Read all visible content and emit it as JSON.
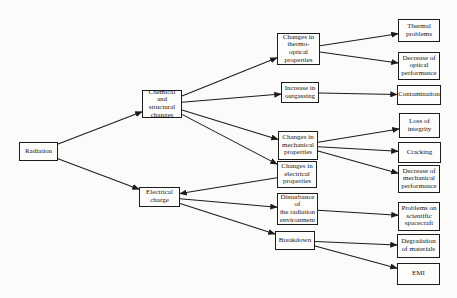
{
  "diagram": {
    "background": "#fbfbf9",
    "box_fill": "#fdfdfc",
    "box_border_color": "#1c1c1c",
    "arrow_color": "#1c1c1c",
    "text_color": "#161616",
    "nodes": [
      {
        "id": "radiation",
        "label": "Radiation",
        "x": 19,
        "y": 142,
        "w": 39,
        "h": 19
      },
      {
        "id": "chemical-changes",
        "label": "Chemical and\nstructural\nchanges",
        "x": 142,
        "y": 90,
        "w": 40,
        "h": 28
      },
      {
        "id": "electrical-charge",
        "label": "Electrical\ncharge",
        "x": 139,
        "y": 187,
        "w": 41,
        "h": 20
      },
      {
        "id": "thermo-optical",
        "label": "Changes in\nthermo-optical\nproperties",
        "x": 277,
        "y": 33,
        "w": 43,
        "h": 32
      },
      {
        "id": "outgassing",
        "label": "Increase in\noutgassing",
        "x": 281,
        "y": 82,
        "w": 38,
        "h": 21
      },
      {
        "id": "mechanical-properties",
        "label": "Changes in\nmechanical\nproperties",
        "x": 278,
        "y": 131,
        "w": 40,
        "h": 29
      },
      {
        "id": "electrical-properties",
        "label": "Changes in\nelectrical\nproperties",
        "x": 277,
        "y": 161,
        "w": 40,
        "h": 27
      },
      {
        "id": "disturbance",
        "label": "Disturbance of\nthe radiation\nenvironment",
        "x": 277,
        "y": 193,
        "w": 41,
        "h": 32
      },
      {
        "id": "breakdown",
        "label": "Breakdown",
        "x": 275,
        "y": 231,
        "w": 40,
        "h": 19
      },
      {
        "id": "thermal-problems",
        "label": "Thermal\nproblems",
        "x": 398,
        "y": 19,
        "w": 42,
        "h": 23
      },
      {
        "id": "decrease-optical",
        "label": "Decrease of\noptical\nperformance",
        "x": 398,
        "y": 52,
        "w": 42,
        "h": 28
      },
      {
        "id": "contamination",
        "label": "Contamination",
        "x": 397,
        "y": 85,
        "w": 44,
        "h": 20
      },
      {
        "id": "loss-of-integrity",
        "label": "Loss of\nintegrity",
        "x": 399,
        "y": 113,
        "w": 41,
        "h": 25
      },
      {
        "id": "cracking",
        "label": "Cracking",
        "x": 398,
        "y": 142,
        "w": 43,
        "h": 21
      },
      {
        "id": "decrease-mechanical",
        "label": "Decrease of\nmechanical\nperformance",
        "x": 398,
        "y": 165,
        "w": 42,
        "h": 28
      },
      {
        "id": "problems-spacecraft",
        "label": "Problems on\nscientific\nspacecraft",
        "x": 398,
        "y": 202,
        "w": 42,
        "h": 29
      },
      {
        "id": "degradation-materials",
        "label": "Degradation\nof materials",
        "x": 397,
        "y": 234,
        "w": 43,
        "h": 24
      },
      {
        "id": "emi",
        "label": "EMI",
        "x": 397,
        "y": 263,
        "w": 43,
        "h": 22
      }
    ],
    "edges": [
      {
        "from": "radiation",
        "to": "chemical-changes"
      },
      {
        "from": "radiation",
        "to": "electrical-charge"
      },
      {
        "from": "chemical-changes",
        "to": "thermo-optical"
      },
      {
        "from": "chemical-changes",
        "to": "outgassing"
      },
      {
        "from": "chemical-changes",
        "to": "mechanical-properties"
      },
      {
        "from": "chemical-changes",
        "to": "electrical-properties"
      },
      {
        "from": "electrical-properties",
        "to": "electrical-charge"
      },
      {
        "from": "electrical-charge",
        "to": "disturbance"
      },
      {
        "from": "electrical-charge",
        "to": "breakdown"
      },
      {
        "from": "thermo-optical",
        "to": "thermal-problems"
      },
      {
        "from": "thermo-optical",
        "to": "decrease-optical"
      },
      {
        "from": "outgassing",
        "to": "contamination"
      },
      {
        "from": "mechanical-properties",
        "to": "loss-of-integrity"
      },
      {
        "from": "mechanical-properties",
        "to": "cracking"
      },
      {
        "from": "mechanical-properties",
        "to": "decrease-mechanical"
      },
      {
        "from": "disturbance",
        "to": "problems-spacecraft"
      },
      {
        "from": "breakdown",
        "to": "degradation-materials"
      },
      {
        "from": "breakdown",
        "to": "emi"
      }
    ]
  }
}
